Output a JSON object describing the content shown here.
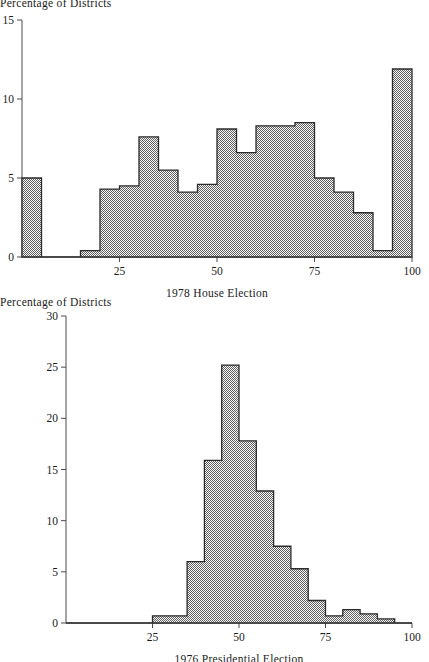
{
  "figure": {
    "background": "#ffffff",
    "ink_color": "#1a1a1a",
    "bar_fill_color": "#a8a8a8",
    "bar_outline_color": "#2b2b2b",
    "axis_color": "#4a4a4a"
  },
  "panels": [
    {
      "id": "top",
      "ylabel": "Percentage of Districts",
      "xlabel": "1978 House Election",
      "ytick_labels": [
        "0",
        "5",
        "10",
        "15"
      ],
      "xtick_labels": [
        "25",
        "50",
        "75",
        "100"
      ]
    },
    {
      "id": "bottom",
      "ylabel": "Percentage of Districts",
      "xlabel": "1976 Presidential Election",
      "ytick_labels": [
        "0",
        "5",
        "10",
        "15",
        "20",
        "25",
        "30"
      ],
      "xtick_labels": [
        "25",
        "50",
        "75",
        "100"
      ]
    }
  ],
  "chart_data": [
    {
      "type": "bar",
      "title": "",
      "xlabel": "1978 House Election",
      "ylabel": "Percentage of Districts",
      "xlim": [
        0,
        100
      ],
      "ylim": [
        0,
        15
      ],
      "yticks": [
        0,
        5,
        10,
        15
      ],
      "xticks": [
        25,
        50,
        75,
        100
      ],
      "grid": false,
      "legend": "none",
      "bin_width": 5,
      "bin_edges": [
        0,
        5,
        10,
        15,
        20,
        25,
        30,
        35,
        40,
        45,
        50,
        55,
        60,
        65,
        70,
        75,
        80,
        85,
        90,
        95,
        100
      ],
      "categories": [
        "0-5",
        "5-10",
        "10-15",
        "15-20",
        "20-25",
        "25-30",
        "30-35",
        "35-40",
        "40-45",
        "45-50",
        "50-55",
        "55-60",
        "60-65",
        "65-70",
        "70-75",
        "75-80",
        "80-85",
        "85-90",
        "90-95",
        "95-100"
      ],
      "values": [
        5.0,
        0.0,
        0.0,
        0.4,
        4.3,
        4.5,
        7.6,
        5.5,
        4.1,
        4.6,
        8.1,
        6.6,
        8.3,
        8.3,
        8.5,
        5.0,
        4.1,
        2.8,
        0.4,
        11.9
      ]
    },
    {
      "type": "bar",
      "title": "",
      "xlabel": "1976 Presidential Election",
      "ylabel": "Percentage of Districts",
      "xlim": [
        0,
        100
      ],
      "ylim": [
        0,
        30
      ],
      "yticks": [
        0,
        5,
        10,
        15,
        20,
        25,
        30
      ],
      "xticks": [
        25,
        50,
        75,
        100
      ],
      "grid": false,
      "legend": "none",
      "bin_width": 5,
      "bin_edges": [
        0,
        5,
        10,
        15,
        20,
        25,
        30,
        35,
        40,
        45,
        50,
        55,
        60,
        65,
        70,
        75,
        80,
        85,
        90,
        95,
        100
      ],
      "categories": [
        "0-5",
        "5-10",
        "10-15",
        "15-20",
        "20-25",
        "25-30",
        "30-35",
        "35-40",
        "40-45",
        "45-50",
        "50-55",
        "55-60",
        "60-65",
        "65-70",
        "70-75",
        "75-80",
        "80-85",
        "85-90",
        "90-95",
        "95-100"
      ],
      "values": [
        0.0,
        0.0,
        0.0,
        0.0,
        0.0,
        0.7,
        0.7,
        6.0,
        15.9,
        25.2,
        17.8,
        12.9,
        7.5,
        5.3,
        2.2,
        0.7,
        1.3,
        0.9,
        0.4,
        0.0
      ]
    }
  ]
}
